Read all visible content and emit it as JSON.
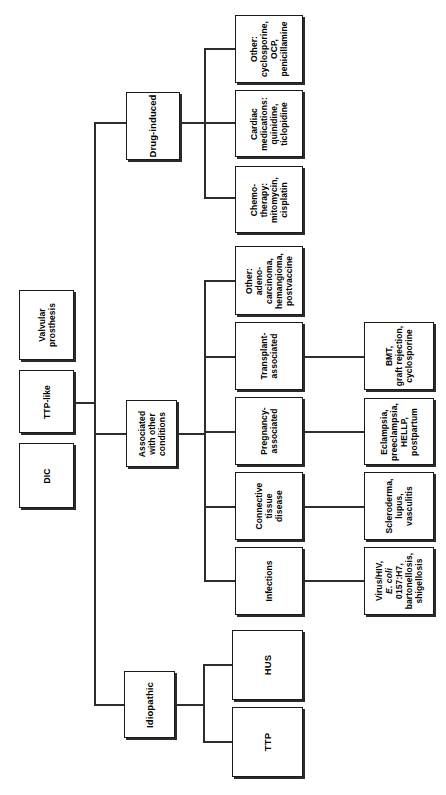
{
  "diagram": {
    "type": "flowchart-tree",
    "orientation": "rotated-90-ccw",
    "line_color": "#2d2d2d",
    "box_border_color": "#1a1a1a",
    "background_color": "#ffffff"
  },
  "nodes": {
    "drug_induced": "Drug-induced",
    "drug_other": "Other:\ncyclosporine,\nOCP,\npenicillamine",
    "drug_cardiac": "Cardiac\nmedications:\nquinidine,\nticlopidine",
    "drug_chemo": "Chemo-\ntherapy:\nmitomycin,\ncisplatin",
    "valvular_prosthesis": "Valvular\nprosthesis",
    "ttp_like": "TTP-like",
    "dic": "DIC",
    "associated": "Associated\nwith other\nconditions",
    "assoc_other": "Other:\nadeno-\ncarcinoma,\nhemangioma,\npostvaccine",
    "assoc_transplant": "Transplant-\nassociated",
    "assoc_pregnancy": "Pregnancy-\nassociated",
    "assoc_connective": "Connective\ntissue\ndisease",
    "assoc_infections": "Infections",
    "leaf_transplant": "BMT,\ngraft rejection,\ncyclosporine",
    "leaf_pregnancy": "Eclampsia,\npreeclampsia,\nHELLP,\npostpartum",
    "leaf_connective": "Scleroderma,\nlupus,\nvasculitis",
    "leaf_infections_line1": "Virus/HIV,",
    "leaf_infections_italic": "E. coli",
    "leaf_infections_rest": "0157:H7,\nbartonellosis,\nshigellosis",
    "idiopathic": "Idiopathic",
    "hus": "HUS",
    "ttp": "TTP"
  }
}
